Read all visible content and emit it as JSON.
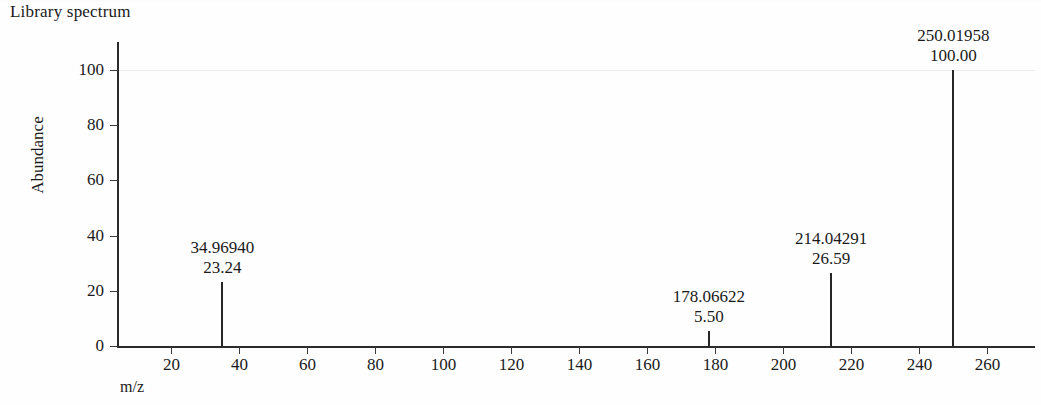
{
  "chart_data": {
    "type": "bar",
    "title": "Library spectrum",
    "xlabel": "m/z",
    "ylabel": "Abundance",
    "xlim": [
      4,
      274
    ],
    "ylim": [
      0,
      110
    ],
    "grid": false,
    "legend": "none",
    "xticks": [
      20,
      40,
      60,
      80,
      100,
      120,
      140,
      160,
      180,
      200,
      220,
      240,
      260
    ],
    "yticks": [
      0,
      20,
      40,
      60,
      80,
      100
    ],
    "x": [
      34.9694,
      178.06622,
      214.04291,
      250.01958
    ],
    "values": [
      23.24,
      5.5,
      26.59,
      100.0
    ],
    "peaks": [
      {
        "mz_label": "34.96940",
        "abundance_label": "23.24",
        "mz": 34.9694,
        "abundance": 23.24
      },
      {
        "mz_label": "178.06622",
        "abundance_label": "5.50",
        "mz": 178.06622,
        "abundance": 5.5
      },
      {
        "mz_label": "214.04291",
        "abundance_label": "26.59",
        "mz": 214.04291,
        "abundance": 26.59
      },
      {
        "mz_label": "250.01958",
        "abundance_label": "100.00",
        "mz": 250.01958,
        "abundance": 100.0
      }
    ]
  },
  "axes": {
    "y_tick_labels": [
      "100",
      "80",
      "60",
      "40",
      "20",
      "0"
    ],
    "x_tick_labels": [
      "20",
      "40",
      "60",
      "80",
      "100",
      "120",
      "140",
      "160",
      "180",
      "200",
      "220",
      "240",
      "260"
    ]
  },
  "colors": {
    "peak": "#262626",
    "axis": "#2b2b2b",
    "text": "#1a1a1a",
    "background": "#fefefe",
    "faint_grid": "#ededf0"
  }
}
